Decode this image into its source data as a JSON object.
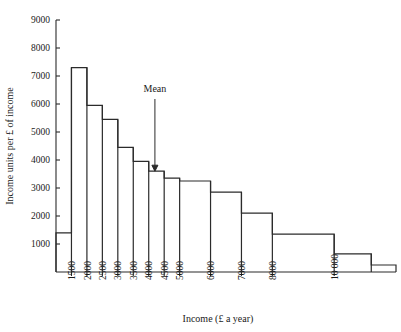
{
  "chart_data": {
    "type": "bar",
    "title": "",
    "subtitle": "",
    "xlabel": "Income (£ a year)",
    "ylabel": "Income units per £ of income",
    "ylim": [
      0,
      9000
    ],
    "xlim": [
      1000,
      12000
    ],
    "grid": false,
    "legend": null,
    "ytick_labels": [
      "1000",
      "2000",
      "3000",
      "4000",
      "5000",
      "6000",
      "7000",
      "8000",
      "9000"
    ],
    "ytick_values": [
      1000,
      2000,
      3000,
      4000,
      5000,
      6000,
      7000,
      8000,
      9000
    ],
    "xtick_labels": [
      "1500",
      "2000",
      "2500",
      "3000",
      "3500",
      "4000",
      "4500",
      "5000",
      "6000",
      "7000",
      "8000",
      "10 000"
    ],
    "xtick_values": [
      1500,
      2000,
      2500,
      3000,
      3500,
      4000,
      4500,
      5000,
      6000,
      7000,
      8000,
      10000
    ],
    "bins": [
      {
        "x0": 1000,
        "x1": 1500,
        "value": 1400
      },
      {
        "x0": 1500,
        "x1": 2000,
        "value": 7300
      },
      {
        "x0": 2000,
        "x1": 2500,
        "value": 5950
      },
      {
        "x0": 2500,
        "x1": 3000,
        "value": 5450
      },
      {
        "x0": 3000,
        "x1": 3500,
        "value": 4450
      },
      {
        "x0": 3500,
        "x1": 4000,
        "value": 3950
      },
      {
        "x0": 4000,
        "x1": 4500,
        "value": 3600
      },
      {
        "x0": 4500,
        "x1": 5000,
        "value": 3350
      },
      {
        "x0": 5000,
        "x1": 6000,
        "value": 3250
      },
      {
        "x0": 6000,
        "x1": 7000,
        "value": 2850
      },
      {
        "x0": 7000,
        "x1": 8000,
        "value": 2100
      },
      {
        "x0": 8000,
        "x1": 10000,
        "value": 1350
      },
      {
        "x0": 10000,
        "x1": 11200,
        "value": 650
      },
      {
        "x0": 11200,
        "x1": 12000,
        "value": 250
      }
    ],
    "annotations": [
      {
        "label": "Mean",
        "x": 4200,
        "arrow": "down",
        "arrow_to": 3600
      }
    ],
    "colors": {
      "line": "#2b2b2b",
      "background": "#ffffff",
      "text": "#1a1a1a"
    }
  }
}
